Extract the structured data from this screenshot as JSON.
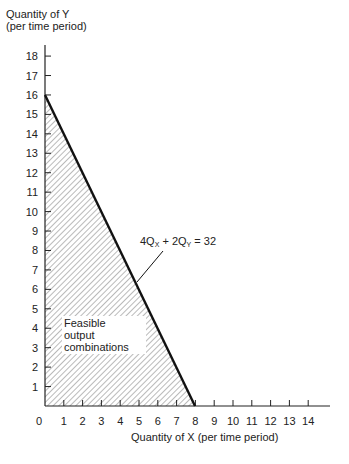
{
  "chart_data": {
    "type": "line",
    "title": "",
    "ylabel_line1": "Quantity of Y",
    "ylabel_line2": "(per time period)",
    "xlabel": "Quantity of X (per time period)",
    "x_ticks": [
      "1",
      "2",
      "3",
      "4",
      "5",
      "6",
      "7",
      "8",
      "9",
      "10",
      "11",
      "12",
      "13",
      "14"
    ],
    "y_ticks": [
      "1",
      "2",
      "3",
      "4",
      "5",
      "6",
      "7",
      "8",
      "9",
      "10",
      "11",
      "12",
      "13",
      "14",
      "15",
      "16",
      "17",
      "18"
    ],
    "origin_label": "0",
    "xlim": [
      0,
      15
    ],
    "ylim": [
      0,
      18.5
    ],
    "series": [
      {
        "name": "4Qx + 2Qy = 32",
        "x": [
          0,
          8
        ],
        "y": [
          16,
          0
        ]
      }
    ],
    "annotations": [
      {
        "text": "4Qx + 2Qy = 32",
        "points_to": [
          5,
          6
        ]
      },
      {
        "text": "Feasible output combinations",
        "region": "shaded area under line"
      }
    ],
    "grid": false,
    "legend": "none"
  },
  "labels": {
    "y_title_1": "Quantity of Y",
    "y_title_2": "(per time period)",
    "x_title": "Quantity of X (per time period)",
    "equation_prefix": "4Q",
    "equation_sub_x": "X",
    "equation_mid": " + 2Q",
    "equation_sub_y": "Y",
    "equation_suffix": " = 32",
    "feasible_1": "Feasible",
    "feasible_2": "output",
    "feasible_3": "combinations",
    "origin": "0"
  },
  "colors": {
    "line": "#111111",
    "hatch": "#555555",
    "axis": "#222222"
  }
}
